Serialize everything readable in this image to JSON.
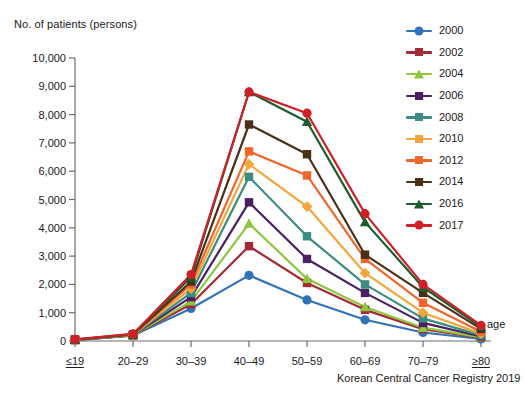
{
  "chart_data": {
    "type": "line",
    "title": "No. of patients (persons)",
    "ylabel": "No. of patients (persons)",
    "xlabel": "age",
    "source": "Korean Central Cancer Registry 2019",
    "categories": [
      "≤19",
      "20–29",
      "30–39",
      "40–49",
      "50–59",
      "60–69",
      "70–79",
      "≥80"
    ],
    "ylim": [
      0,
      10000
    ],
    "ytick_labels": [
      "0",
      "1,000",
      "2,000",
      "3,000",
      "4,000",
      "5,000",
      "6,000",
      "7,000",
      "8,000",
      "9,000",
      "10,000"
    ],
    "ytick_values": [
      0,
      1000,
      2000,
      3000,
      4000,
      5000,
      6000,
      7000,
      8000,
      9000,
      10000
    ],
    "grid": false,
    "legend_position": "right-top",
    "series": [
      {
        "name": "2000",
        "color": "#3173b8",
        "marker": "circle",
        "values": [
          30,
          190,
          1150,
          2320,
          1450,
          750,
          300,
          70
        ]
      },
      {
        "name": "2002",
        "color": "#a42a36",
        "marker": "square",
        "values": [
          40,
          200,
          1300,
          3350,
          2050,
          1100,
          420,
          110
        ]
      },
      {
        "name": "2004",
        "color": "#8fc63f",
        "marker": "triangle",
        "values": [
          35,
          200,
          1400,
          4150,
          2200,
          1200,
          470,
          130
        ]
      },
      {
        "name": "2006",
        "color": "#4b1f63",
        "marker": "square",
        "values": [
          35,
          205,
          1550,
          4900,
          2900,
          1700,
          640,
          160
        ]
      },
      {
        "name": "2008",
        "color": "#3b8c82",
        "marker": "square",
        "values": [
          40,
          210,
          1700,
          5800,
          3700,
          2000,
          800,
          200
        ]
      },
      {
        "name": "2010",
        "color": "#f4a63a",
        "marker": "diamond",
        "values": [
          45,
          215,
          1850,
          6250,
          4750,
          2400,
          1000,
          260
        ]
      },
      {
        "name": "2012",
        "color": "#f0652b",
        "marker": "square",
        "values": [
          45,
          220,
          2000,
          6700,
          5850,
          2900,
          1350,
          330
        ]
      },
      {
        "name": "2014",
        "color": "#4a3018",
        "marker": "square",
        "values": [
          50,
          230,
          2100,
          7650,
          6600,
          3050,
          1700,
          430
        ]
      },
      {
        "name": "2016",
        "color": "#1d5c2e",
        "marker": "triangle",
        "values": [
          50,
          240,
          2250,
          8800,
          7750,
          4200,
          1900,
          500
        ]
      },
      {
        "name": "2017",
        "color": "#cf2027",
        "marker": "circle",
        "values": [
          55,
          250,
          2350,
          8800,
          8050,
          4500,
          2000,
          550
        ]
      }
    ]
  }
}
